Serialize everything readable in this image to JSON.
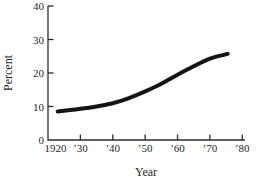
{
  "chart_data": {
    "type": "line",
    "title": "",
    "xlabel": "Year",
    "ylabel": "Percent",
    "xlim": [
      1920,
      1980
    ],
    "ylim": [
      0,
      40
    ],
    "grid": false,
    "legend": false,
    "x_tick_values": [
      1920,
      1930,
      1940,
      1950,
      1960,
      1970,
      1980
    ],
    "x_tick_labels": [
      "1920",
      "’30",
      "’40",
      "’50",
      "’60",
      "’70",
      "’80"
    ],
    "y_tick_values": [
      0,
      10,
      20,
      30,
      40
    ],
    "y_tick_labels": [
      "0",
      "10",
      "20",
      "30",
      "40"
    ],
    "series": [
      {
        "name": "percent-over-time",
        "x": [
          1923,
          1930,
          1935,
          1940,
          1945,
          1950,
          1955,
          1960,
          1965,
          1970,
          1975.5
        ],
        "values": [
          8.5,
          9.3,
          10.0,
          11.0,
          12.5,
          14.5,
          16.8,
          19.5,
          22.0,
          24.3,
          25.7
        ],
        "color": "#141414",
        "line_width": 4
      }
    ]
  },
  "colors": {
    "background": "#ffffff",
    "axis": "#2b2b2b",
    "text": "#1f1f1f"
  }
}
